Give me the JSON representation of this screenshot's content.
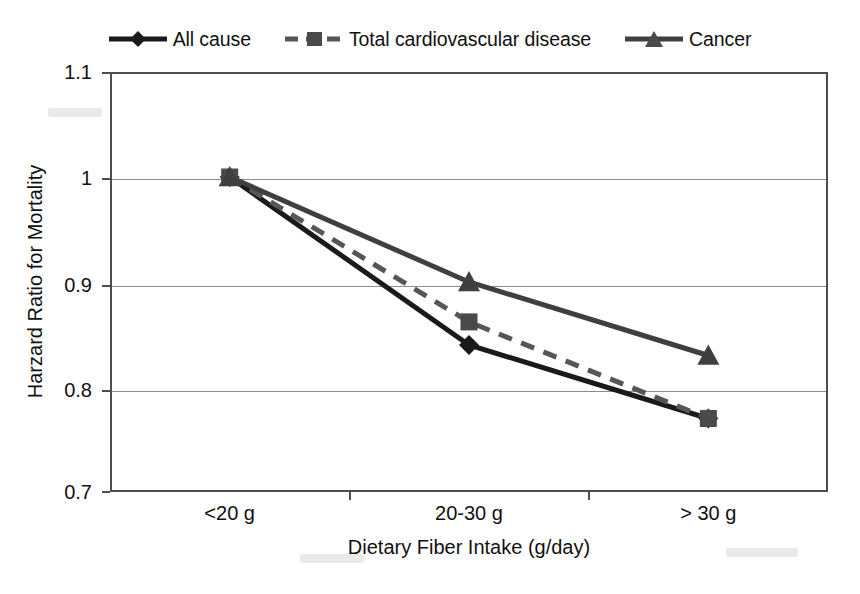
{
  "chart_data": {
    "type": "line",
    "title": "",
    "xlabel": "Dietary Fiber Intake (g/day)",
    "ylabel": "Harzard Ratio for Mortality",
    "categories": [
      "<20 g",
      "20-30 g",
      "> 30 g"
    ],
    "ytick_labels": [
      "1.1",
      "1",
      "0.9",
      "0.8",
      "0.7"
    ],
    "ytick_values": [
      1.1,
      1,
      0.9,
      0.8,
      0.7
    ],
    "ylim": [
      0.7,
      1.1
    ],
    "grid": "horizontal",
    "legend_position": "top-center",
    "series": [
      {
        "name": "All cause",
        "values": [
          1.0,
          0.84,
          0.77
        ],
        "color": "#1a1a1a",
        "marker": "diamond",
        "linestyle": "solid"
      },
      {
        "name": "Total cardiovascular disease",
        "values": [
          1.0,
          0.862,
          0.77
        ],
        "color": "#565656",
        "marker": "square",
        "linestyle": "dashed"
      },
      {
        "name": "Cancer",
        "values": [
          1.0,
          0.9,
          0.83
        ],
        "color": "#3f3f3f",
        "marker": "triangle",
        "linestyle": "solid"
      }
    ]
  },
  "legend": {
    "items": [
      {
        "label": "All cause",
        "marker": "diamond-marker-icon"
      },
      {
        "label": "Total cardiovascular disease",
        "marker": "square-marker-icon"
      },
      {
        "label": "Cancer",
        "marker": "triangle-marker-icon"
      }
    ]
  },
  "axes": {
    "y_title": "Harzard Ratio for Mortality",
    "x_title": "Dietary Fiber Intake (g/day)",
    "y_ticks": [
      "1.1",
      "1",
      "0.9",
      "0.8",
      "0.7"
    ],
    "x_ticks": [
      "<20 g",
      "20-30 g",
      "> 30 g"
    ]
  }
}
